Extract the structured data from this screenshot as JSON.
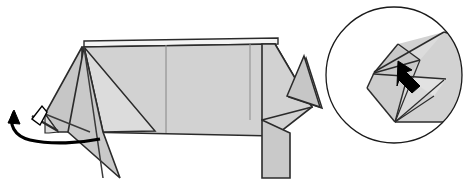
{
  "figure": {
    "canvas": {
      "width": 464,
      "height": 185
    },
    "background_color": "#ffffff"
  },
  "style": {
    "paper_front_color": "#d2d2d2",
    "paper_shade_color": "#c6c6c6",
    "paper_light_color": "#dcdcdc",
    "paper_white_color": "#f4f4f4",
    "edge_color": "#2b2b2b",
    "crease_color": "#8c8c8c",
    "arrow_fill_color": "#000000",
    "hollow_arrow_fill": "#ffffff",
    "circle_stroke_color": "#1a1a1a",
    "edge_width": 1.6,
    "crease_width": 1.0,
    "circle_width": 1.3
  },
  "main_model": {
    "name": "origami-pig-side-view",
    "body": {
      "name": "body-panel",
      "points": "82,47 275,44 312,107 275,136 82,132",
      "fill": "paper_front_color"
    },
    "body_top_strip": {
      "name": "body-top-layer-strip",
      "points": "84,41 278,38 278,44 84,47",
      "fill": "paper_white_color"
    },
    "snout": {
      "name": "snout-panel",
      "points": "82,47 45,114 58,132 82,132",
      "fill": "paper_shade_color"
    },
    "snout_lower": {
      "name": "snout-lower-fold",
      "points": "45,114 58,132 49,133 45,133",
      "fill": "paper_light_color"
    },
    "front_leg": {
      "name": "front-leg-panel",
      "points": "84,47 103,132 120,178 68,132",
      "fill": "paper_shade_color"
    },
    "front_leg_back": {
      "name": "front-leg-back-panel",
      "points": "84,47 155,131 103,132",
      "fill": "paper_light_color"
    },
    "rear_leg": {
      "name": "rear-leg-panel",
      "points": "262,120 290,133 290,178 262,178",
      "fill": "paper_shade_color"
    },
    "head_wedge": {
      "name": "head-wedge-panel",
      "points": "275,44 312,107 262,120 262,44",
      "fill": "paper_front_color"
    },
    "ear": {
      "name": "ear-triangle",
      "points": "304,56 320,107 287,96",
      "fill": "paper_shade_color"
    },
    "ear_outline": {
      "name": "ear-outline",
      "points": "306,58 322,108 289,97"
    },
    "creases": [
      {
        "name": "body-center-crease",
        "points": "166,45 166,133"
      },
      {
        "name": "body-quarter-crease",
        "points": "250,44 250,120"
      },
      {
        "name": "leg-fold-crease",
        "points": "84,47 103,178"
      },
      {
        "name": "snout-crease",
        "points": "45,114 90,132"
      }
    ]
  },
  "rotation_arrow": {
    "name": "rotate-arrow",
    "description": "Curved arrow at lower left indicating the snout flap swings down and around",
    "path": "M 14,112 C 8,124 14,136 30,140 C 52,145 80,143 100,139",
    "head_points": "14,110 20,124 8,123",
    "stroke_width": 3.2
  },
  "push_arrow": {
    "name": "push-fold-arrow",
    "description": "Small hollow arrow on the snout indicating a reverse fold push",
    "shaft_points": "36,114 42,110 48,121 42,125",
    "head_points": "32,119 42,106 47,112 40,125",
    "line_points": "32,116 58,131"
  },
  "detail_inset": {
    "name": "magnified-detail-circle",
    "circle": {
      "cx": 394,
      "cy": 75,
      "r": 68
    },
    "faces": [
      {
        "name": "inset-body-panel",
        "points": "444,32 464,38 464,122 395,122 372,74 398,44",
        "fill": "paper_front_color"
      },
      {
        "name": "inset-top-flap",
        "points": "374,72 444,32 420,60 398,46",
        "fill": "paper_light_color"
      },
      {
        "name": "inset-upper-wedge",
        "points": "398,46 420,60 407,78 374,73",
        "fill": "paper_shade_color"
      },
      {
        "name": "inset-left-panel",
        "points": "374,74 407,78 395,122 367,88",
        "fill": "paper_shade_color"
      },
      {
        "name": "inset-lower-wedge",
        "points": "407,78 444,80 395,122",
        "fill": "paper_light_color"
      },
      {
        "name": "inset-mid-flap",
        "points": "407,78 446,79 434,96",
        "fill": "paper_light_color"
      }
    ],
    "edges": [
      {
        "name": "inset-edge-outer-top",
        "points": "444,32 464,38"
      },
      {
        "name": "inset-edge-left-upper",
        "points": "444,32 374,72"
      },
      {
        "name": "inset-edge-flap-fold",
        "points": "398,44 420,60"
      },
      {
        "name": "inset-edge-flap-diag",
        "points": "420,60 374,73"
      },
      {
        "name": "inset-edge-upper-left",
        "points": "398,44 374,73"
      },
      {
        "name": "inset-edge-left-vert",
        "points": "374,73 367,88"
      },
      {
        "name": "inset-edge-left-lower",
        "points": "367,88 395,122"
      },
      {
        "name": "inset-edge-bottom",
        "points": "395,122 464,122"
      },
      {
        "name": "inset-edge-mid-diag",
        "points": "407,78 395,122"
      },
      {
        "name": "inset-edge-mid-horiz",
        "points": "374,74 446,79"
      },
      {
        "name": "inset-edge-fan-a",
        "points": "395,122 444,80"
      },
      {
        "name": "inset-edge-fan-b",
        "points": "395,122 420,60"
      },
      {
        "name": "inset-edge-fan-c",
        "points": "395,122 434,96"
      }
    ],
    "arrow": {
      "name": "inset-push-arrow",
      "description": "Solid black arrow pointing up-left into the pocket",
      "points": "398,61 412,70 406,72 420,86 412,93 399,80 397,86"
    }
  }
}
